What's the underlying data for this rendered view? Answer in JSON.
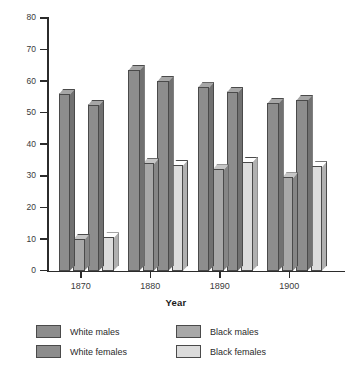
{
  "chart_data": {
    "type": "bar",
    "title": "",
    "xlabel": "Year",
    "ylabel": "",
    "categories": [
      "1870",
      "1880",
      "1890",
      "1900"
    ],
    "ylim": [
      0,
      80
    ],
    "yticks": [
      0,
      10,
      20,
      30,
      40,
      50,
      60,
      70,
      80
    ],
    "grid": false,
    "legend_position": "bottom",
    "style": "3d-grouped-bar",
    "series": [
      {
        "name": "White males",
        "color": "#8d8d8d",
        "values": [
          56,
          63.5,
          58,
          53
        ]
      },
      {
        "name": "Black males",
        "color": "#a8a8a8",
        "values": [
          10,
          34,
          32,
          29.5
        ]
      },
      {
        "name": "White females",
        "color": "#8d8d8d",
        "values": [
          52.5,
          60,
          56.5,
          54
        ]
      },
      {
        "name": "Black females",
        "color": "#dcdcdc",
        "values": [
          10.5,
          33.5,
          34.5,
          33
        ]
      }
    ]
  },
  "axis": {
    "x_title": "Year",
    "y_tick_labels": [
      "80",
      "70",
      "60",
      "50",
      "40",
      "30",
      "20",
      "10",
      "0"
    ],
    "x_tick_labels": [
      "1870",
      "1880",
      "1890",
      "1900"
    ]
  },
  "legend": {
    "items": [
      {
        "label": "White males",
        "color": "#8d8d8d"
      },
      {
        "label": "Black males",
        "color": "#a8a8a8"
      },
      {
        "label": "White females",
        "color": "#8d8d8d"
      },
      {
        "label": "Black females",
        "color": "#dcdcdc"
      }
    ]
  },
  "caption": {
    "text": ""
  }
}
